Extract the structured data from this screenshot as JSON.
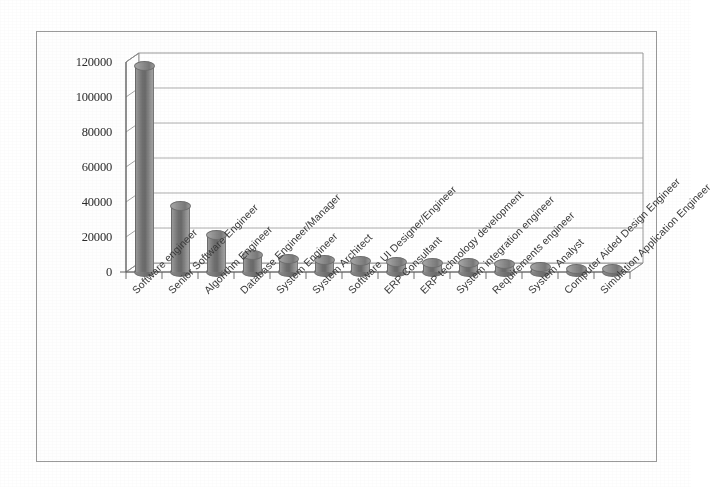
{
  "chart_data": {
    "type": "bar",
    "title": "",
    "subtitle": "",
    "xlabel": "",
    "ylabel": "",
    "ylim": [
      0,
      120000
    ],
    "ytick_step": 20000,
    "yticks": [
      "0",
      "20000",
      "40000",
      "60000",
      "80000",
      "100000",
      "120000"
    ],
    "grid": true,
    "legend": "none",
    "style": "3d-cylinder",
    "bar_color": "#7a7a7a",
    "categories": [
      "Software engineer",
      "Senior Software Engineer",
      "Algorithm Engineer",
      "Database Engineer/Manager",
      "System Engineer",
      "System Architect",
      "Software UI Designer/Engineer",
      "ERP Consultant",
      "ERP technology development",
      "System integration engineer",
      "Requirements engineer",
      "System Analyst",
      "Computer Aided Design Engineer",
      "Simulation Application Engineer"
    ],
    "values": [
      118000,
      38000,
      21000,
      9500,
      7200,
      6600,
      6300,
      6000,
      5200,
      4900,
      4500,
      2600,
      2000,
      1500
    ]
  },
  "frame": {
    "border_color": "#9a9a9a",
    "background": "#fefefe"
  }
}
